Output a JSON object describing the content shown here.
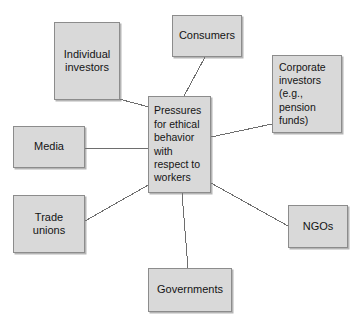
{
  "diagram": {
    "title": "Pressures for ethical behavior with respect to workers",
    "type": "hub-and-spoke",
    "canvas": {
      "width": 354,
      "height": 324,
      "background": "#ffffff"
    },
    "style": {
      "node_fill": "#d9d9d9",
      "node_border": "#8c8c8c",
      "connector_color": "#6e6e6e",
      "text_color": "#141414"
    },
    "center": {
      "id": "pressures",
      "label": "Pressures\nfor ethical\nbehavior\nwith\nrespect to\nworkers",
      "x": 148,
      "y": 96,
      "w": 63,
      "h": 97
    },
    "nodes": [
      {
        "id": "individual-investors",
        "label": "Individual\ninvestors",
        "x": 54,
        "y": 22,
        "w": 66,
        "h": 78
      },
      {
        "id": "consumers",
        "label": "Consumers",
        "x": 172,
        "y": 15,
        "w": 70,
        "h": 42
      },
      {
        "id": "corporate-investors",
        "label": "Corporate\ninvestors\n(e.g.,\npension\nfunds)",
        "x": 272,
        "y": 55,
        "w": 70,
        "h": 78
      },
      {
        "id": "media",
        "label": "Media",
        "x": 13,
        "y": 126,
        "w": 72,
        "h": 42
      },
      {
        "id": "trade-unions",
        "label": "Trade\nunions",
        "x": 13,
        "y": 195,
        "w": 72,
        "h": 58
      },
      {
        "id": "ngos",
        "label": "NGOs",
        "x": 288,
        "y": 205,
        "w": 60,
        "h": 43
      },
      {
        "id": "governments",
        "label": "Governments",
        "x": 148,
        "y": 268,
        "w": 84,
        "h": 44
      }
    ],
    "connectors": [
      {
        "id": "individual-investors-to-center",
        "from": "individual-investors",
        "to": "pressures",
        "x1": 119,
        "y1": 99,
        "x2": 149,
        "y2": 107
      },
      {
        "id": "consumers-to-center",
        "from": "consumers",
        "to": "pressures",
        "x1": 205,
        "y1": 57,
        "x2": 184,
        "y2": 96
      },
      {
        "id": "corporate-investors-to-center",
        "from": "corporate-investors",
        "to": "pressures",
        "x1": 272,
        "y1": 124,
        "x2": 211,
        "y2": 137
      },
      {
        "id": "media-to-center",
        "from": "media",
        "to": "pressures",
        "x1": 85,
        "y1": 148,
        "x2": 148,
        "y2": 148
      },
      {
        "id": "trade-unions-to-center",
        "from": "trade-unions",
        "to": "pressures",
        "x1": 85,
        "y1": 221,
        "x2": 150,
        "y2": 184
      },
      {
        "id": "ngos-to-center",
        "from": "ngos",
        "to": "pressures",
        "x1": 288,
        "y1": 226,
        "x2": 211,
        "y2": 183
      },
      {
        "id": "governments-to-center",
        "from": "governments",
        "to": "pressures",
        "x1": 188,
        "y1": 268,
        "x2": 182,
        "y2": 193
      }
    ]
  }
}
